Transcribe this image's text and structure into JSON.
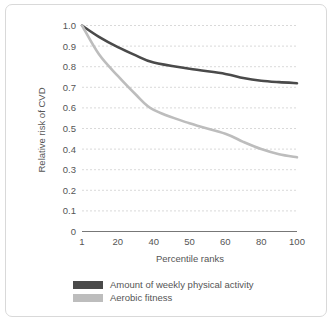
{
  "chart_data": {
    "type": "line",
    "title": "",
    "xlabel": "Percentile ranks",
    "ylabel": "Relative risk of CVD",
    "xlim": [
      1,
      100
    ],
    "ylim": [
      0,
      1.0
    ],
    "grid": true,
    "legend_position": "bottom-left",
    "x_ticks": [
      "1",
      "20",
      "40",
      "50",
      "60",
      "80",
      "100"
    ],
    "x_tick_values": [
      1,
      20,
      40,
      50,
      60,
      80,
      100
    ],
    "y_ticks": [
      "0",
      "0.1",
      "0.2",
      "0.3",
      "0.4",
      "0.5",
      "0.6",
      "0.7",
      "0.8",
      "0.9",
      "1.0"
    ],
    "y_tick_values": [
      0,
      0.1,
      0.2,
      0.3,
      0.4,
      0.5,
      0.6,
      0.7,
      0.8,
      0.9,
      1.0
    ],
    "x": [
      1,
      10,
      20,
      30,
      40,
      50,
      60,
      70,
      80,
      90,
      100
    ],
    "series": [
      {
        "name": "Amount of weekly physical activity",
        "color": "#4a4a4a",
        "values": [
          1.0,
          0.945,
          0.895,
          0.855,
          0.82,
          0.79,
          0.765,
          0.745,
          0.732,
          0.725,
          0.72
        ]
      },
      {
        "name": "Aerobic fitness",
        "color": "#bdbdbd",
        "values": [
          1.0,
          0.86,
          0.755,
          0.665,
          0.59,
          0.525,
          0.475,
          0.435,
          0.4,
          0.375,
          0.36
        ]
      }
    ]
  },
  "legend": {
    "items": [
      {
        "label": "Amount of weekly physical activity",
        "color": "#4a4a4a"
      },
      {
        "label": "Aerobic fitness",
        "color": "#bdbdbd"
      }
    ]
  }
}
